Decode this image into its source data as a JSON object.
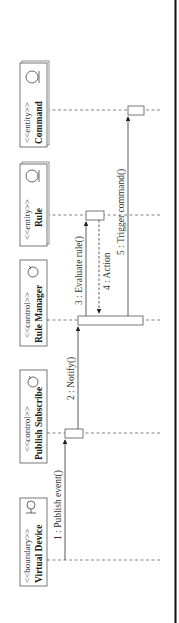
{
  "diagram": {
    "type": "sequence",
    "orientation": "rotated-90-ccw",
    "participants": [
      {
        "id": "virtual-device",
        "stereotype": "<<boundary>>",
        "name": "Virtual Device",
        "icon": "boundary-icon"
      },
      {
        "id": "publish-subscribe",
        "stereotype": "<<control>>",
        "name": "Publish Subscribe",
        "icon": "control-icon"
      },
      {
        "id": "rule-manager",
        "stereotype": "<<control>>",
        "name": "Rule Manager",
        "icon": "control-icon"
      },
      {
        "id": "rule",
        "stereotype": "<<entity>>",
        "name": "Rule",
        "icon": "entity-icon"
      },
      {
        "id": "command",
        "stereotype": "<<entity>>",
        "name": "Command",
        "icon": "entity-icon"
      }
    ],
    "messages": [
      {
        "label": "1 : Publish event()",
        "from": "virtual-device",
        "to": "publish-subscribe",
        "style": "sync"
      },
      {
        "label": "2 : Notify()",
        "from": "publish-subscribe",
        "to": "rule-manager",
        "style": "sync"
      },
      {
        "label": "3 : Evaluate rule()",
        "from": "rule-manager",
        "to": "rule",
        "style": "sync"
      },
      {
        "label": "4 : Action",
        "from": "rule",
        "to": "rule-manager",
        "style": "return"
      },
      {
        "label": "5 : Trigger command()",
        "from": "rule-manager",
        "to": "command",
        "style": "sync"
      }
    ]
  }
}
